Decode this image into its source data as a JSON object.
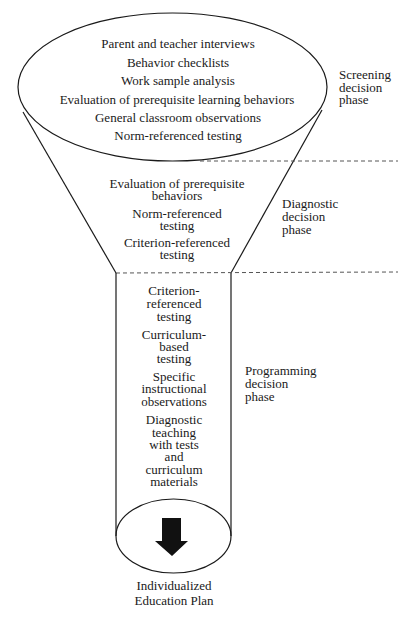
{
  "diagram": {
    "colors": {
      "line": "#1a1a1a",
      "dash": "#555555",
      "background": "#ffffff"
    },
    "screening": {
      "items": [
        "Parent and teacher interviews",
        "Behavior checklists",
        "Work sample analysis",
        "Evaluation of prerequisite learning behaviors",
        "General classroom observations",
        "Norm-referenced testing"
      ],
      "phase_label": [
        "Screening",
        "decision",
        "phase"
      ]
    },
    "diagnostic": {
      "lines": [
        "Evaluation of prerequisite",
        "behaviors",
        "Norm-referenced",
        "testing",
        "Criterion-referenced",
        "testing"
      ],
      "phase_label": [
        "Diagnostic",
        "decision",
        "phase"
      ]
    },
    "programming": {
      "lines": [
        "Criterion-",
        "referenced",
        "testing",
        "Curriculum-",
        "based",
        "testing",
        "Specific",
        "instructional",
        "observations",
        "Diagnostic",
        "teaching",
        "with tests",
        "and",
        "curriculum",
        "materials"
      ],
      "phase_label": [
        "Programming",
        "decision",
        "phase"
      ]
    },
    "outcome": {
      "icon": "down-arrow-icon",
      "lines": [
        "Individualized",
        "Education Plan"
      ]
    }
  }
}
